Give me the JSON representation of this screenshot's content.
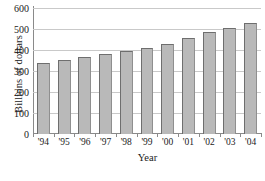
{
  "chart_data": {
    "type": "bar",
    "title": "",
    "xlabel": "Year",
    "ylabel": "Billions of dollars",
    "categories": [
      "'94",
      "'95",
      "'96",
      "'97",
      "'98",
      "'99",
      "'00",
      "'01",
      "'02",
      "'03",
      "'04"
    ],
    "values": [
      337,
      352,
      368,
      383,
      395,
      408,
      430,
      458,
      485,
      506,
      530
    ],
    "series": [
      {
        "name": "Billions of dollars",
        "values": [
          337,
          352,
          368,
          383,
          395,
          408,
          430,
          458,
          485,
          506,
          530
        ]
      }
    ],
    "ylim": [
      0,
      600
    ],
    "yticks": [
      0,
      100,
      200,
      300,
      400,
      500,
      600
    ],
    "ytick_labels": [
      "0",
      "100",
      "200",
      "300",
      "400",
      "500",
      "600"
    ],
    "grid": true,
    "grid_axis": "y",
    "legend": false,
    "bar_color": "#b9b9b9",
    "bar_edge_color": "#6e6e6e",
    "gridline_color": "#c9c9c9",
    "axis_color": "#8a8a8a",
    "background_color": "#ffffff"
  }
}
